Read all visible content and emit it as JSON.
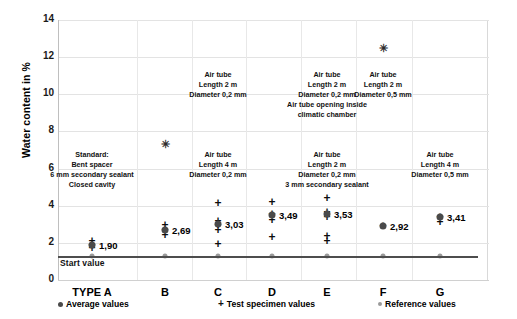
{
  "chart_data": {
    "type": "scatter",
    "title": "",
    "xlabel": "",
    "ylabel": "Water content in %",
    "ylim": [
      0,
      14
    ],
    "yticks": [
      0,
      2,
      4,
      6,
      8,
      10,
      12,
      14
    ],
    "grid": true,
    "legend_position": "bottom",
    "start_value_label": "Start value",
    "start_value": 1.3,
    "categories": [
      "TYPE A",
      "B",
      "C",
      "D",
      "E",
      "F",
      "G"
    ],
    "series": [
      {
        "name": "Average values",
        "marker": "filled-circle",
        "values": [
          1.9,
          2.69,
          3.03,
          3.49,
          3.53,
          2.92,
          3.41
        ]
      },
      {
        "name": "Reference values",
        "marker": "grey-circle",
        "values": [
          1.29,
          1.29,
          1.29,
          1.29,
          1.29,
          1.29,
          1.29
        ]
      },
      {
        "name": "Statistical outliers",
        "marker": "asterisk",
        "values": [
          null,
          7.3,
          null,
          null,
          null,
          12.5,
          null
        ]
      }
    ],
    "test_specimen_values": [
      {
        "category": "TYPE A",
        "values": [
          1.75,
          1.9,
          2.08
        ]
      },
      {
        "category": "B",
        "values": [
          2.42,
          2.69,
          2.95
        ]
      },
      {
        "category": "C",
        "values": [
          1.95,
          2.7,
          2.95,
          3.2,
          4.15
        ]
      },
      {
        "category": "D",
        "values": [
          2.3,
          3.25,
          3.55,
          4.18
        ]
      },
      {
        "category": "E",
        "values": [
          2.1,
          2.35,
          3.4,
          3.68,
          4.4
        ]
      },
      {
        "category": "F",
        "values": [
          2.92
        ]
      },
      {
        "category": "G",
        "values": [
          3.1,
          3.41
        ]
      }
    ],
    "value_labels": [
      "1,90",
      "2,69",
      "3,03",
      "3,49",
      "3,53",
      "2,92",
      "3,41"
    ],
    "annotations": [
      {
        "category": "TYPE A",
        "y": 7.0,
        "lines": [
          "Standard:",
          "Bent spacer",
          "6 mm secondary sealant",
          "Closed cavity"
        ]
      },
      {
        "category": "C",
        "y": 11.3,
        "lines": [
          "Air tube",
          "Length 2 m",
          "Diameter 0,2 mm"
        ]
      },
      {
        "category": "C",
        "y": 7.0,
        "lines": [
          "Air tube",
          "Length 4 m",
          "Diameter 0,2 mm"
        ]
      },
      {
        "category": "E",
        "y": 11.3,
        "lines": [
          "Air tube",
          "Length 2 m",
          "Diameter 0,2 mm",
          "Air tube opening inside",
          "climatic chamber"
        ]
      },
      {
        "category": "E",
        "y": 7.0,
        "lines": [
          "Air tube",
          "Length 2 m",
          "Diameter 0,2 mm",
          "3 mm secondary sealant"
        ]
      },
      {
        "category": "F",
        "y": 11.3,
        "lines": [
          "Air tube",
          "Length 2 m",
          "Diameter 0,5 mm"
        ]
      },
      {
        "category": "G",
        "y": 7.0,
        "lines": [
          "Air tube",
          "Length 4 m",
          "Diameter 0,5 mm"
        ]
      }
    ],
    "legend": [
      {
        "glyph": "filled-circle",
        "label": "Average values"
      },
      {
        "glyph": "plus",
        "label": "Test specimen values"
      },
      {
        "glyph": "grey-circle",
        "label": "Reference values"
      },
      {
        "glyph": "cross",
        "label": "Statistical outliers"
      }
    ]
  }
}
